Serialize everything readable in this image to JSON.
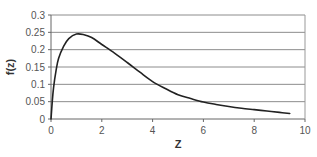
{
  "chart_data": {
    "type": "line",
    "title": "",
    "xlabel": "Z",
    "ylabel": "f(z)",
    "xlim": [
      0,
      10
    ],
    "ylim": [
      0,
      0.3
    ],
    "xticks": [
      "0",
      "2",
      "4",
      "6",
      "8",
      "10"
    ],
    "yticks": [
      "0",
      "0.05",
      "0.1",
      "0.15",
      "0.2",
      "0.25",
      "0.3"
    ],
    "grid": "horizontal",
    "legend": "none",
    "series": [
      {
        "name": "f(z)",
        "color": "#222222",
        "x": [
          0,
          0.05,
          0.1,
          0.2,
          0.3,
          0.5,
          0.7,
          1.0,
          1.3,
          1.6,
          2.0,
          2.5,
          3.0,
          3.5,
          4.0,
          4.5,
          5.0,
          5.5,
          6.0,
          6.5,
          7.0,
          7.5,
          8.0,
          8.5,
          9.0,
          9.4
        ],
        "values": [
          0,
          0.05,
          0.09,
          0.14,
          0.175,
          0.21,
          0.232,
          0.245,
          0.243,
          0.235,
          0.215,
          0.19,
          0.163,
          0.135,
          0.108,
          0.088,
          0.07,
          0.059,
          0.049,
          0.042,
          0.036,
          0.031,
          0.027,
          0.023,
          0.019,
          0.016
        ]
      }
    ]
  }
}
